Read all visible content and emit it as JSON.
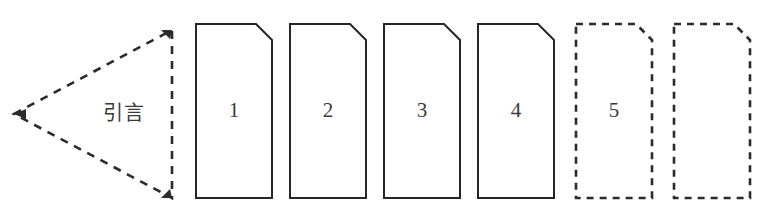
{
  "figure": {
    "title": "",
    "background_color": "#ffffff",
    "stroke_color": "#262626",
    "dashed_stroke_color": "#2b2b2b",
    "fill_color": "#ffffff"
  },
  "wedge": {
    "label": "引言",
    "style": "dashed",
    "apex_x": 14,
    "apex_y": 114,
    "right_x": 172,
    "top_y": 30,
    "bottom_y": 198,
    "label_x": 124,
    "label_y": 114
  },
  "cards": [
    {
      "label": "1",
      "style": "solid",
      "x": 196,
      "y": 24,
      "width": 76,
      "height": 174,
      "corner_cut": 16
    },
    {
      "label": "2",
      "style": "solid",
      "x": 290,
      "y": 24,
      "width": 76,
      "height": 174,
      "corner_cut": 16
    },
    {
      "label": "3",
      "style": "solid",
      "x": 384,
      "y": 24,
      "width": 76,
      "height": 174,
      "corner_cut": 16
    },
    {
      "label": "4",
      "style": "solid",
      "x": 478,
      "y": 24,
      "width": 76,
      "height": 174,
      "corner_cut": 16
    },
    {
      "label": "5",
      "style": "dashed",
      "x": 576,
      "y": 24,
      "width": 76,
      "height": 174,
      "corner_cut": 16
    },
    {
      "label": "",
      "style": "dashed",
      "x": 674,
      "y": 24,
      "width": 76,
      "height": 174,
      "corner_cut": 16
    }
  ]
}
